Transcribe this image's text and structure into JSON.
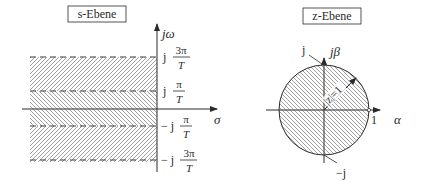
{
  "s_plane": {
    "title": "s-Ebene",
    "axis_imag": "jω",
    "axis_real": "σ",
    "ticks": [
      {
        "prefix": "j",
        "num": "3π",
        "den": "T"
      },
      {
        "prefix": "j",
        "num": "π",
        "den": "T"
      },
      {
        "prefix": "− j",
        "num": "π",
        "den": "T"
      },
      {
        "prefix": "− j",
        "num": "3π",
        "den": "T"
      }
    ]
  },
  "z_plane": {
    "title": "z-Ebene",
    "axis_imag": "jβ",
    "axis_real": "α",
    "label_j": "j",
    "label_minus_j": "−j",
    "label_one": "1",
    "radius_label": "|z|=1"
  },
  "colors": {
    "line": "#2a2a2a",
    "hatch": "#8a8a8a"
  }
}
